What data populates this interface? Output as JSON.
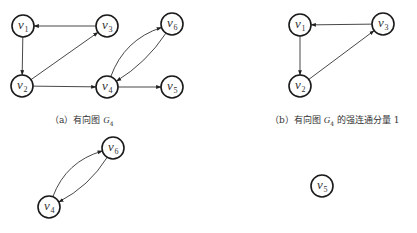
{
  "figure": {
    "panels": [
      {
        "id": "a",
        "caption_prefix": "（a）有向图 ",
        "caption_graph": "G",
        "caption_sub": "4",
        "caption_suffix": "",
        "nodes": [
          {
            "id": "v1",
            "label": "v",
            "sub": "1",
            "x": 23,
            "y": 26
          },
          {
            "id": "v2",
            "label": "v",
            "sub": "2",
            "x": 22,
            "y": 86
          },
          {
            "id": "v3",
            "label": "v",
            "sub": "3",
            "x": 107,
            "y": 26
          },
          {
            "id": "v4",
            "label": "v",
            "sub": "4",
            "x": 107,
            "y": 87
          },
          {
            "id": "v5",
            "label": "v",
            "sub": "5",
            "x": 172,
            "y": 87
          },
          {
            "id": "v6",
            "label": "v",
            "sub": "6",
            "x": 172,
            "y": 24
          }
        ],
        "edges": [
          {
            "from": "v3",
            "to": "v1",
            "curve": 0
          },
          {
            "from": "v1",
            "to": "v2",
            "curve": 0
          },
          {
            "from": "v2",
            "to": "v3",
            "curve": 0
          },
          {
            "from": "v2",
            "to": "v4",
            "curve": 0
          },
          {
            "from": "v4",
            "to": "v5",
            "curve": 0
          },
          {
            "from": "v4",
            "to": "v6",
            "curve": -22
          },
          {
            "from": "v6",
            "to": "v4",
            "curve": -10
          }
        ]
      },
      {
        "id": "b",
        "caption_prefix": "（b）有向图 ",
        "caption_graph": "G",
        "caption_sub": "4",
        "caption_suffix": " 的强连通分量 1",
        "nodes": [
          {
            "id": "v1",
            "label": "v",
            "sub": "1",
            "x": 300,
            "y": 25
          },
          {
            "id": "v2",
            "label": "v",
            "sub": "2",
            "x": 300,
            "y": 86
          },
          {
            "id": "v3",
            "label": "v",
            "sub": "3",
            "x": 383,
            "y": 24
          }
        ],
        "edges": [
          {
            "from": "v3",
            "to": "v1",
            "curve": 0
          },
          {
            "from": "v1",
            "to": "v2",
            "curve": 0
          },
          {
            "from": "v2",
            "to": "v3",
            "curve": 0
          }
        ]
      },
      {
        "id": "c",
        "nodes": [
          {
            "id": "v4",
            "label": "v",
            "sub": "4",
            "x": 49,
            "y": 207
          },
          {
            "id": "v6",
            "label": "v",
            "sub": "6",
            "x": 113,
            "y": 148
          }
        ],
        "edges": [
          {
            "from": "v4",
            "to": "v6",
            "curve": -22
          },
          {
            "from": "v6",
            "to": "v4",
            "curve": -12
          }
        ]
      },
      {
        "id": "d",
        "nodes": [
          {
            "id": "v5",
            "label": "v",
            "sub": "5",
            "x": 322,
            "y": 186
          }
        ],
        "edges": []
      }
    ],
    "style": {
      "node_radius": 11,
      "stroke_color": "#1a1a1a",
      "edge_color": "#333333"
    }
  }
}
